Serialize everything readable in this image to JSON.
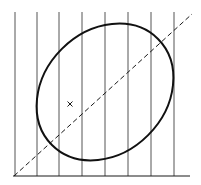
{
  "diagram": {
    "colors": {
      "background": "#ffffff",
      "stroke": "#1a1a1a",
      "grid": "#555555"
    },
    "vertical_lines_x": [
      15,
      37,
      59,
      82,
      105,
      128,
      151,
      174
    ],
    "vertical_lines_top": 12,
    "baseline": {
      "x1": 13,
      "x2": 190,
      "y": 176
    },
    "diagonal": {
      "x1": 14,
      "y1": 176,
      "x2": 192,
      "y2": 14,
      "style": "dashed"
    },
    "ellipse": {
      "cx": 105,
      "cy": 92,
      "rx": 75,
      "ry": 61,
      "rotation_deg": -45
    },
    "marker": {
      "symbol": "x",
      "x": 70,
      "y": 104
    }
  }
}
